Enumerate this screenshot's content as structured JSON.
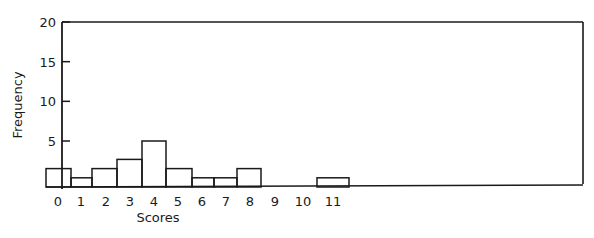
{
  "chart_data": {
    "type": "bar",
    "title": "",
    "xlabel": "Scores",
    "ylabel": "Frequency",
    "categories": [
      "0",
      "1",
      "2",
      "3",
      "4",
      "5",
      "6",
      "7",
      "8",
      "9",
      "10",
      "11"
    ],
    "values": [
      2,
      1,
      2,
      3,
      5,
      2,
      1,
      1,
      2,
      0,
      0,
      1
    ],
    "ylim": [
      0,
      20
    ],
    "yticks": [
      5,
      10,
      15,
      20
    ],
    "grid": false,
    "legend": null,
    "style": "histogram"
  },
  "colors": {
    "ink": "#1a1a1a",
    "background": "#ffffff"
  }
}
